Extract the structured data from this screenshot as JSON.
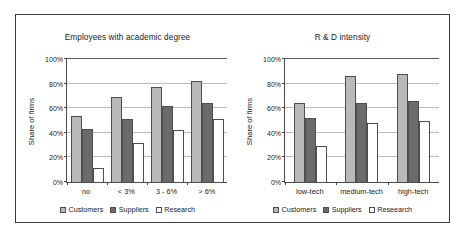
{
  "figure": {
    "series_colors": [
      "#b9b9b9",
      "#6b6b6b",
      "#ffffff"
    ]
  },
  "chart_data": [
    {
      "type": "bar",
      "title": "Employees with academic degree",
      "xlabel": "",
      "ylabel": "Share of firms",
      "categories": [
        "no",
        "< 3%",
        "3 - 6%",
        "> 6%"
      ],
      "series": [
        {
          "name": "Customers",
          "values": [
            54,
            69,
            77,
            82
          ]
        },
        {
          "name": "Suppliers",
          "values": [
            43,
            51,
            62,
            64
          ]
        },
        {
          "name": "Research",
          "values": [
            11,
            32,
            42,
            51
          ]
        }
      ],
      "ylim": [
        0,
        100
      ],
      "yticks": [
        0,
        20,
        40,
        60,
        80,
        100
      ],
      "ytick_labels": [
        "0%",
        "20%",
        "40%",
        "60%",
        "80%",
        "100%"
      ],
      "grid": true,
      "legend_position": "bottom"
    },
    {
      "type": "bar",
      "title": "R & D intensity",
      "xlabel": "",
      "ylabel": "Share of firms",
      "categories": [
        "low-tech",
        "medium-tech",
        "high-tech"
      ],
      "series": [
        {
          "name": "Customers",
          "values": [
            64,
            86,
            88
          ]
        },
        {
          "name": "Suppliers",
          "values": [
            52,
            64,
            66
          ]
        },
        {
          "name": "Reseearch",
          "values": [
            29,
            48,
            50
          ]
        }
      ],
      "ylim": [
        0,
        100
      ],
      "yticks": [
        0,
        20,
        40,
        60,
        80,
        100
      ],
      "ytick_labels": [
        "0%",
        "20%",
        "40%",
        "60%",
        "80%",
        "100%"
      ],
      "grid": true,
      "legend_position": "bottom"
    }
  ]
}
